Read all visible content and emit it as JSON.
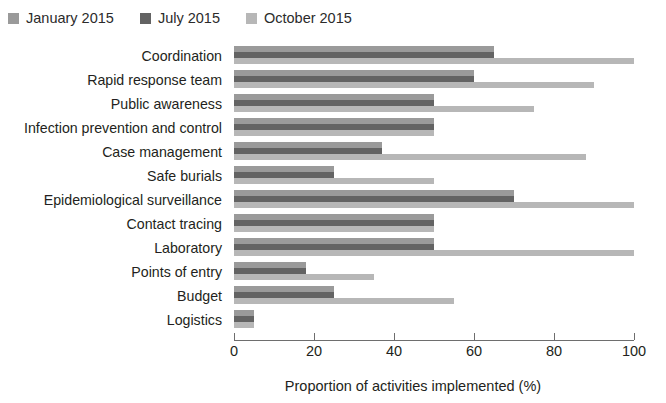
{
  "legend": {
    "position": "top-left",
    "entries": [
      {
        "label": "January 2015",
        "color": "#9a9a9a",
        "swatch_name": "legend-swatch-january"
      },
      {
        "label": "July 2015",
        "color": "#636363",
        "swatch_name": "legend-swatch-july"
      },
      {
        "label": "October 2015",
        "color": "#b7b7b7",
        "swatch_name": "legend-swatch-october"
      }
    ]
  },
  "axis": {
    "ticks": [
      0,
      20,
      40,
      60,
      80,
      100
    ],
    "tick_labels": [
      "0",
      "20",
      "40",
      "60",
      "80",
      "100"
    ],
    "xlabel": "Proportion of activities implemented (%)"
  },
  "chart_data": {
    "type": "bar",
    "orientation": "horizontal",
    "title": "",
    "xlabel": "Proportion of activities implemented (%)",
    "ylabel": "",
    "xlim": [
      0,
      100
    ],
    "grid": false,
    "legend_position": "top-left",
    "categories": [
      "Coordination",
      "Rapid response team",
      "Public awareness",
      "Infection prevention and control",
      "Case management",
      "Safe burials",
      "Epidemiological surveillance",
      "Contact tracing",
      "Laboratory",
      "Points of entry",
      "Budget",
      "Logistics"
    ],
    "series": [
      {
        "name": "January 2015",
        "color": "#9a9a9a",
        "values": [
          65,
          60,
          50,
          50,
          37,
          25,
          70,
          50,
          50,
          18,
          25,
          5
        ]
      },
      {
        "name": "July 2015",
        "color": "#636363",
        "values": [
          65,
          60,
          50,
          50,
          37,
          25,
          70,
          50,
          50,
          18,
          25,
          5
        ]
      },
      {
        "name": "October 2015",
        "color": "#b7b7b7",
        "values": [
          100,
          90,
          75,
          50,
          88,
          50,
          100,
          50,
          100,
          35,
          55,
          5
        ]
      }
    ]
  }
}
